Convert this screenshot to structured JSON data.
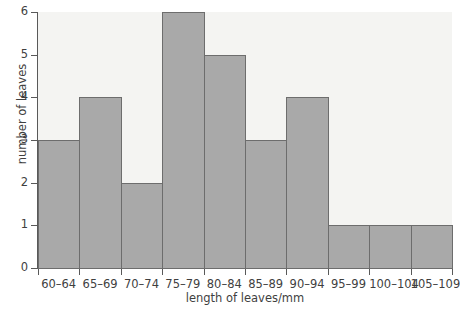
{
  "chart_data": {
    "type": "bar",
    "title": "",
    "subtitle": "",
    "xlabel": "length of leaves/mm",
    "ylabel": "number of leaves",
    "categories": [
      "60–64",
      "65–69",
      "70–74",
      "75–79",
      "80–84",
      "85–89",
      "90–94",
      "95–99",
      "100–104",
      "105–109"
    ],
    "values": [
      3,
      4,
      2,
      6,
      5,
      3,
      4,
      1,
      1,
      1
    ],
    "ylim": [
      0,
      6
    ],
    "yticks": [
      0,
      1,
      2,
      3,
      4,
      5,
      6
    ],
    "ytick_labels": [
      "0",
      "1",
      "2",
      "3",
      "4",
      "5",
      "6"
    ],
    "xtick_labels": [
      "60–64",
      "65–69",
      "70–74",
      "75–79",
      "80–84",
      "85–89",
      "90–94",
      "95–99",
      "100–104",
      "105–109"
    ],
    "grid": false,
    "legend": null,
    "legend_position": "none",
    "bar_fill_color": "#a9a9a9",
    "bar_border_color": "#6d6d6d",
    "plot_background_color": "#f4f4f2",
    "axis_color": "#595959",
    "text_color": "#3f3f3f",
    "annotations": []
  }
}
